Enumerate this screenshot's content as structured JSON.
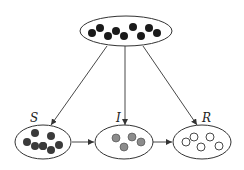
{
  "diagram": {
    "type": "compartment-model",
    "source": {
      "label": "",
      "dot_style": "filled-black",
      "dot_count": 9
    },
    "compartments": [
      {
        "id": "S",
        "label": "S",
        "dot_style": "filled-dark",
        "dot_count": 8
      },
      {
        "id": "I",
        "label": "I",
        "dot_style": "filled-gray",
        "dot_count": 4
      },
      {
        "id": "R",
        "label": "R",
        "dot_style": "hollow",
        "dot_count": 5
      }
    ],
    "edges": [
      {
        "from": "source",
        "to": "S"
      },
      {
        "from": "source",
        "to": "I"
      },
      {
        "from": "source",
        "to": "R"
      },
      {
        "from": "S",
        "to": "I"
      },
      {
        "from": "I",
        "to": "R"
      }
    ],
    "colors": {
      "stroke": "#333333",
      "dot_black": "#1a1a1a",
      "dot_dark": "#3a3a3a",
      "dot_gray": "#8c8c8c",
      "dot_hollow_fill": "#ffffff"
    }
  }
}
